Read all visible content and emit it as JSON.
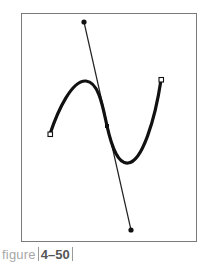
{
  "figure": {
    "caption_word": "figure",
    "caption_number": "4–50",
    "frame_color": "#7a7a7a",
    "curve_color": "#111111",
    "elements": {
      "anchors": [
        {
          "name": "left-anchor",
          "x": 50,
          "y": 134,
          "type": "hollow-square"
        },
        {
          "name": "middle-anchor",
          "x": 107,
          "y": 126,
          "type": "smooth-point"
        },
        {
          "name": "right-anchor",
          "x": 161,
          "y": 80,
          "type": "hollow-square"
        }
      ],
      "handles": [
        {
          "name": "top-handle",
          "x": 84,
          "y": 22,
          "type": "filled-dot"
        },
        {
          "name": "bottom-handle",
          "x": 131,
          "y": 230,
          "type": "filled-dot"
        }
      ]
    }
  }
}
